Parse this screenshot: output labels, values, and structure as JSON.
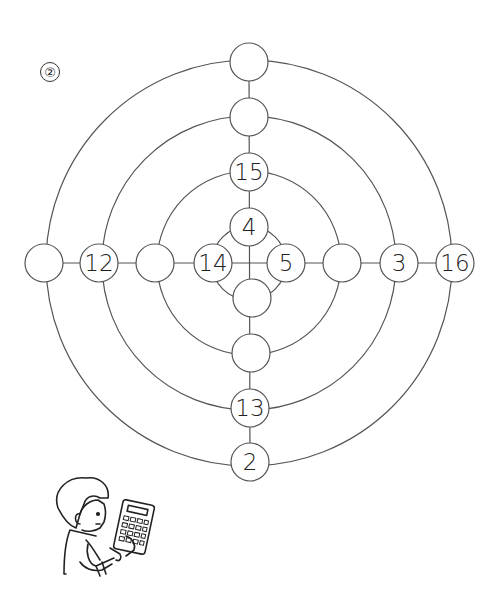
{
  "problem_label": "②",
  "diagram": {
    "center": [
      249,
      263
    ],
    "ring_radii": [
      37,
      92,
      147,
      203
    ],
    "stroke_color": "#555555",
    "node_radius": 19,
    "nodes": [
      {
        "id": "top-outer",
        "x": 249,
        "y": 62,
        "value": ""
      },
      {
        "id": "top-ring3",
        "x": 249,
        "y": 117,
        "value": ""
      },
      {
        "id": "top-ring2",
        "x": 249,
        "y": 172,
        "value": "15"
      },
      {
        "id": "top-ring1",
        "x": 249,
        "y": 227,
        "value": "4"
      },
      {
        "id": "left-outer",
        "x": 44,
        "y": 263,
        "value": ""
      },
      {
        "id": "left-ring3",
        "x": 99,
        "y": 263,
        "value": "12"
      },
      {
        "id": "left-ring2",
        "x": 155,
        "y": 263,
        "value": ""
      },
      {
        "id": "left-ring1",
        "x": 213,
        "y": 263,
        "value": "14"
      },
      {
        "id": "right-ring1",
        "x": 286,
        "y": 263,
        "value": "5"
      },
      {
        "id": "right-ring2",
        "x": 342,
        "y": 263,
        "value": ""
      },
      {
        "id": "right-ring3",
        "x": 399,
        "y": 263,
        "value": "3"
      },
      {
        "id": "right-outer",
        "x": 455,
        "y": 263,
        "value": "16"
      },
      {
        "id": "bottom-ring1",
        "x": 252,
        "y": 298,
        "value": ""
      },
      {
        "id": "bottom-ring2",
        "x": 251,
        "y": 353,
        "value": ""
      },
      {
        "id": "bottom-ring3",
        "x": 250,
        "y": 408,
        "value": "13"
      },
      {
        "id": "bottom-outer",
        "x": 250,
        "y": 462,
        "value": "2"
      }
    ]
  },
  "illustration": "child-with-calculator"
}
